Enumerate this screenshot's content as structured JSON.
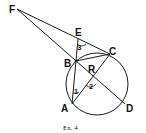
{
  "figure": {
    "caption": "Ex. 4",
    "points": {
      "F": "F",
      "E": "E",
      "C": "C",
      "B": "B",
      "R": "R",
      "A": "A",
      "D": "D"
    },
    "angles": {
      "one": "1",
      "two": "2",
      "three": "3"
    },
    "stroke_color": "#1a1a1a"
  }
}
